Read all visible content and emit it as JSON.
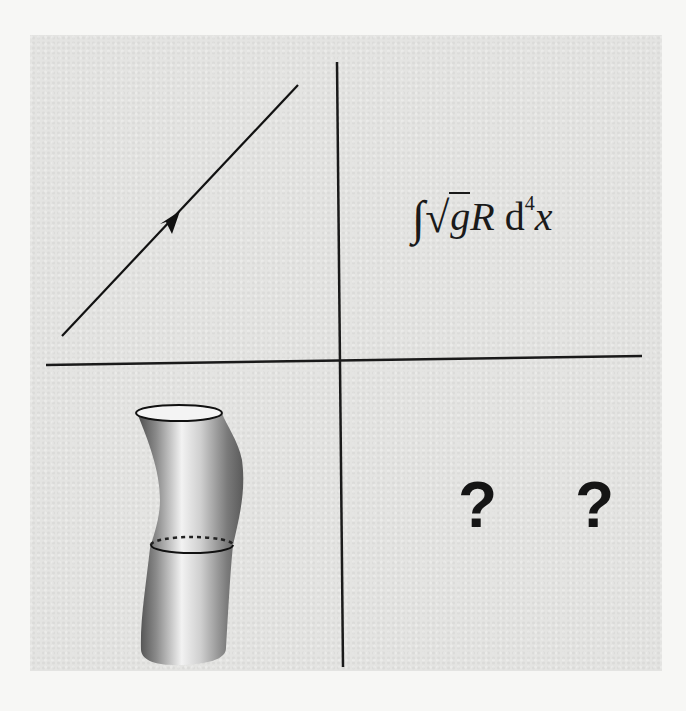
{
  "figure": {
    "quadrants": {
      "top_left": {
        "content": "worldline-with-arrow"
      },
      "top_right": {
        "formula": {
          "integral": "∫",
          "sqrt": "√",
          "radicand": "g",
          "term": "R",
          "measure": "d",
          "exponent": "4",
          "variable": "x"
        }
      },
      "bottom_left": {
        "content": "string-worldsheet-tube"
      },
      "bottom_right": {
        "text": "? ?"
      }
    },
    "colors": {
      "panel": "#e4e4e2",
      "ink": "#1a1a1a",
      "page": "#f7f7f5"
    }
  }
}
